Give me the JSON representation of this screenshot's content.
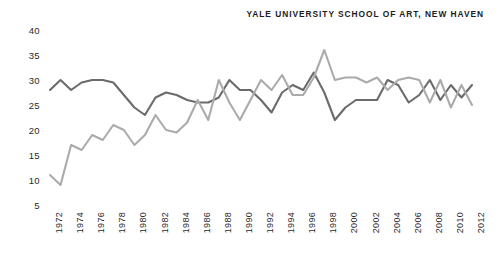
{
  "title": "YALE UNIVERSITY SCHOOL OF ART, NEW HAVEN",
  "chart_data": {
    "type": "line",
    "title": "YALE UNIVERSITY SCHOOL OF ART, NEW HAVEN",
    "xlabel": "",
    "ylabel": "",
    "ylim": [
      5,
      40
    ],
    "xlim": [
      1972,
      2012
    ],
    "grid": false,
    "legend": "none",
    "ytick_labels": [
      "40",
      "35",
      "30",
      "25",
      "20",
      "15",
      "10",
      "5"
    ],
    "ytick_values": [
      40,
      35,
      30,
      25,
      20,
      15,
      10,
      5
    ],
    "xtick_labels": [
      "1972",
      "1974",
      "1976",
      "1978",
      "1980",
      "1982",
      "1984",
      "1986",
      "1988",
      "1990",
      "1992",
      "1994",
      "1996",
      "1998",
      "2000",
      "2002",
      "2004",
      "2006",
      "2008",
      "2010",
      "2012"
    ],
    "xtick_values": [
      1972,
      1974,
      1976,
      1978,
      1980,
      1982,
      1984,
      1986,
      1988,
      1990,
      1992,
      1994,
      1996,
      1998,
      2000,
      2002,
      2004,
      2006,
      2008,
      2010,
      2012
    ],
    "x": [
      1972,
      1973,
      1974,
      1975,
      1976,
      1977,
      1978,
      1979,
      1980,
      1981,
      1982,
      1983,
      1984,
      1985,
      1986,
      1987,
      1988,
      1989,
      1990,
      1991,
      1992,
      1993,
      1994,
      1995,
      1996,
      1997,
      1998,
      1999,
      2000,
      2001,
      2002,
      2003,
      2004,
      2005,
      2006,
      2007,
      2008,
      2009,
      2010,
      2011,
      2012
    ],
    "series": [
      {
        "name": "series-dark",
        "color": "#6b6b6b",
        "values": [
          28.0,
          30.0,
          28.0,
          29.5,
          30.0,
          30.0,
          29.5,
          27.0,
          24.5,
          23.0,
          26.5,
          27.5,
          27.0,
          26.0,
          25.5,
          25.5,
          26.5,
          30.0,
          28.0,
          28.0,
          26.0,
          23.5,
          27.5,
          29.0,
          28.0,
          31.5,
          27.5,
          22.0,
          24.5,
          26.0,
          26.0,
          26.0,
          30.0,
          29.0,
          25.5,
          27.0,
          30.0,
          26.0,
          29.0,
          26.5,
          29.0
        ]
      },
      {
        "name": "series-light",
        "color": "#ababab",
        "values": [
          11.0,
          9.0,
          17.0,
          16.0,
          19.0,
          18.0,
          21.0,
          20.0,
          17.0,
          19.0,
          23.0,
          20.0,
          19.5,
          21.5,
          26.0,
          22.0,
          30.0,
          25.5,
          22.0,
          26.0,
          30.0,
          28.0,
          31.0,
          27.0,
          27.0,
          30.5,
          36.0,
          30.0,
          30.5,
          30.5,
          29.5,
          30.5,
          28.0,
          30.0,
          30.5,
          30.0,
          25.5,
          30.0,
          24.5,
          29.0,
          25.0
        ]
      }
    ]
  }
}
